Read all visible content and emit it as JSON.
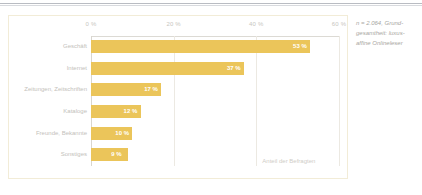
{
  "chart_data": {
    "type": "bar",
    "orientation": "horizontal",
    "title": "",
    "xlabel": "Anteil der Befragten",
    "ylabel": "",
    "categories": [
      "Geschäft",
      "Internet",
      "Zeitungen, Zeitschriften",
      "Kataloge",
      "Freunde, Bekannte",
      "Sonstiges"
    ],
    "values": [
      53,
      37,
      17,
      12,
      10,
      9
    ],
    "value_labels": [
      "53 %",
      "37 %",
      "17 %",
      "12 %",
      "10 %",
      "9 %"
    ],
    "xlim": [
      0,
      60
    ],
    "xticks": [
      0,
      20,
      40,
      60
    ],
    "xtick_labels": [
      "0 %",
      "20 %",
      "40 %",
      "60 %"
    ],
    "grid": true,
    "legend": "none",
    "bar_color": "#ebc55a",
    "value_label_color": "#ffffff"
  },
  "axis_caption": "Anteil der Befragten",
  "side_note": {
    "line1": "n = 2.064, Grund-",
    "line2": "gesamtheit: luxus-",
    "line3": "affine Onlineleser"
  }
}
